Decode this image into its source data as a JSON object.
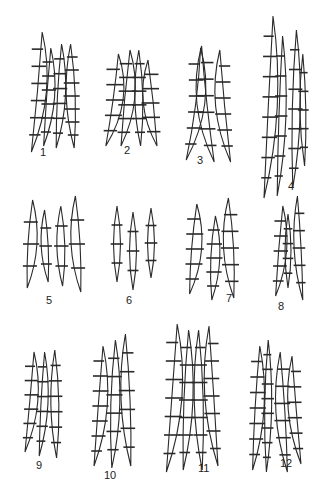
{
  "figure": {
    "stroke": "#2a2a2a",
    "groups": [
      {
        "label": "1",
        "lx": 44,
        "ly": 152,
        "spores": [
          {
            "x": 26,
            "y": 32,
            "w": 18,
            "h": 120,
            "bend": 12,
            "septa": 6
          },
          {
            "x": 38,
            "y": 48,
            "w": 16,
            "h": 98,
            "bend": 8,
            "septa": 6
          },
          {
            "x": 50,
            "y": 44,
            "w": 16,
            "h": 104,
            "bend": 6,
            "septa": 6
          },
          {
            "x": 64,
            "y": 44,
            "w": 18,
            "h": 104,
            "bend": -4,
            "septa": 7
          }
        ]
      },
      {
        "label": "2",
        "lx": 128,
        "ly": 150,
        "spores": [
          {
            "x": 100,
            "y": 54,
            "w": 20,
            "h": 92,
            "bend": 14,
            "septa": 5
          },
          {
            "x": 114,
            "y": 50,
            "w": 20,
            "h": 96,
            "bend": 10,
            "septa": 6
          },
          {
            "x": 132,
            "y": 50,
            "w": 16,
            "h": 96,
            "bend": -2,
            "septa": 6
          },
          {
            "x": 144,
            "y": 60,
            "w": 20,
            "h": 86,
            "bend": -10,
            "septa": 5
          }
        ]
      },
      {
        "label": "3",
        "lx": 201,
        "ly": 160,
        "spores": [
          {
            "x": 182,
            "y": 48,
            "w": 18,
            "h": 112,
            "bend": 16,
            "septa": 6
          },
          {
            "x": 200,
            "y": 46,
            "w": 20,
            "h": 116,
            "bend": -14,
            "septa": 6
          },
          {
            "x": 218,
            "y": 50,
            "w": 18,
            "h": 112,
            "bend": -12,
            "septa": 6
          }
        ]
      },
      {
        "label": "4",
        "lx": 292,
        "ly": 186,
        "spores": [
          {
            "x": 258,
            "y": 16,
            "w": 18,
            "h": 182,
            "bend": 10,
            "septa": 8
          },
          {
            "x": 272,
            "y": 36,
            "w": 14,
            "h": 160,
            "bend": 6,
            "septa": 7
          },
          {
            "x": 286,
            "y": 30,
            "w": 16,
            "h": 158,
            "bend": 4,
            "septa": 7
          },
          {
            "x": 298,
            "y": 54,
            "w": 12,
            "h": 112,
            "bend": -2,
            "septa": 5
          }
        ]
      },
      {
        "label": "5",
        "lx": 50,
        "ly": 300,
        "spores": [
          {
            "x": 20,
            "y": 200,
            "w": 18,
            "h": 88,
            "bend": 6,
            "septa": 3
          },
          {
            "x": 40,
            "y": 210,
            "w": 14,
            "h": 72,
            "bend": -4,
            "septa": 3
          },
          {
            "x": 54,
            "y": 206,
            "w": 16,
            "h": 80,
            "bend": -2,
            "septa": 3
          },
          {
            "x": 70,
            "y": 196,
            "w": 18,
            "h": 96,
            "bend": -6,
            "septa": 3
          }
        ]
      },
      {
        "label": "6",
        "lx": 130,
        "ly": 300,
        "spores": [
          {
            "x": 110,
            "y": 206,
            "w": 14,
            "h": 76,
            "bend": 0,
            "septa": 3
          },
          {
            "x": 126,
            "y": 212,
            "w": 14,
            "h": 78,
            "bend": 0,
            "septa": 3
          },
          {
            "x": 144,
            "y": 208,
            "w": 14,
            "h": 70,
            "bend": 0,
            "septa": 3
          }
        ]
      },
      {
        "label": "7",
        "lx": 230,
        "ly": 298,
        "spores": [
          {
            "x": 182,
            "y": 204,
            "w": 20,
            "h": 90,
            "bend": 8,
            "septa": 5
          },
          {
            "x": 204,
            "y": 216,
            "w": 18,
            "h": 84,
            "bend": 4,
            "septa": 5
          },
          {
            "x": 222,
            "y": 198,
            "w": 20,
            "h": 100,
            "bend": -6,
            "septa": 5
          }
        ]
      },
      {
        "label": "8",
        "lx": 282,
        "ly": 306,
        "spores": [
          {
            "x": 270,
            "y": 206,
            "w": 16,
            "h": 90,
            "bend": 8,
            "septa": 5
          },
          {
            "x": 282,
            "y": 214,
            "w": 12,
            "h": 74,
            "bend": 0,
            "septa": 4
          },
          {
            "x": 294,
            "y": 196,
            "w": 14,
            "h": 104,
            "bend": -6,
            "septa": 5
          }
        ]
      },
      {
        "label": "9",
        "lx": 40,
        "ly": 465,
        "spores": [
          {
            "x": 20,
            "y": 352,
            "w": 16,
            "h": 100,
            "bend": 10,
            "septa": 6
          },
          {
            "x": 34,
            "y": 352,
            "w": 14,
            "h": 104,
            "bend": 6,
            "septa": 6
          },
          {
            "x": 48,
            "y": 350,
            "w": 16,
            "h": 108,
            "bend": -2,
            "septa": 6
          }
        ]
      },
      {
        "label": "10",
        "lx": 108,
        "ly": 475,
        "spores": [
          {
            "x": 88,
            "y": 346,
            "w": 18,
            "h": 120,
            "bend": 10,
            "septa": 7
          },
          {
            "x": 104,
            "y": 340,
            "w": 18,
            "h": 128,
            "bend": 4,
            "septa": 6
          },
          {
            "x": 120,
            "y": 334,
            "w": 18,
            "h": 132,
            "bend": -6,
            "septa": 6
          }
        ]
      },
      {
        "label": "11",
        "lx": 202,
        "ly": 468,
        "spores": [
          {
            "x": 160,
            "y": 324,
            "w": 20,
            "h": 148,
            "bend": 12,
            "septa": 7
          },
          {
            "x": 176,
            "y": 330,
            "w": 18,
            "h": 140,
            "bend": 6,
            "septa": 7
          },
          {
            "x": 192,
            "y": 330,
            "w": 18,
            "h": 140,
            "bend": -4,
            "septa": 7
          },
          {
            "x": 206,
            "y": 326,
            "w": 18,
            "h": 140,
            "bend": -10,
            "septa": 7
          }
        ]
      },
      {
        "label": "12",
        "lx": 284,
        "ly": 463,
        "spores": [
          {
            "x": 246,
            "y": 346,
            "w": 18,
            "h": 124,
            "bend": 8,
            "septa": 7
          },
          {
            "x": 260,
            "y": 340,
            "w": 14,
            "h": 132,
            "bend": 2,
            "septa": 8
          },
          {
            "x": 276,
            "y": 352,
            "w": 18,
            "h": 120,
            "bend": -8,
            "septa": 6
          },
          {
            "x": 290,
            "y": 356,
            "w": 16,
            "h": 108,
            "bend": -10,
            "septa": 6
          }
        ]
      }
    ]
  }
}
